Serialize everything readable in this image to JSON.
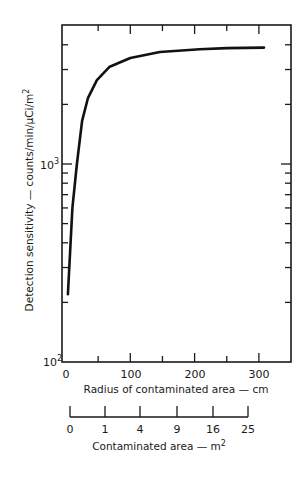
{
  "chart_data": {
    "type": "line",
    "title": "",
    "xlabel": "Radius of contaminated area — cm",
    "ylabel": "Detection sensitivity — counts/min/μCi/m²",
    "yscale": "log",
    "xlim": [
      0,
      350
    ],
    "ylim": [
      100,
      5000
    ],
    "x_ticks": [
      0,
      100,
      200,
      300
    ],
    "x_tick_labels": [
      "0",
      "100",
      "200",
      "300"
    ],
    "y_ticks": [
      100,
      1000
    ],
    "y_tick_labels": [
      "10",
      "10"
    ],
    "y_tick_exponents": [
      "2",
      "3"
    ],
    "grid": false,
    "legend": null,
    "series": [
      {
        "name": "Detection sensitivity",
        "x": [
          3,
          10,
          17,
          25,
          34,
          48,
          68,
          100,
          146,
          208,
          250,
          308
        ],
        "values": [
          220,
          600,
          1000,
          1650,
          2150,
          2650,
          3100,
          3430,
          3680,
          3800,
          3850,
          3870
        ]
      }
    ],
    "secondary_axis": {
      "label": "Contaminated area — m",
      "label_superscript": "2",
      "ticks": [
        "0",
        "1",
        "4",
        "9",
        "16",
        "25"
      ]
    }
  },
  "labels": {
    "x_title": "Radius of contaminated area — cm",
    "y_title_main": "Detection sensitivity — counts/min/μCi/m",
    "y_title_sup": "2",
    "y_tick_base": "10",
    "y_tick_exp_low": "2",
    "y_tick_exp_high": "3",
    "x_ticks": [
      "0",
      "100",
      "200",
      "300"
    ],
    "area_title_main": "Contaminated area — m",
    "area_title_sup": "2",
    "area_ticks": [
      "0",
      "1",
      "4",
      "9",
      "16",
      "25"
    ]
  }
}
